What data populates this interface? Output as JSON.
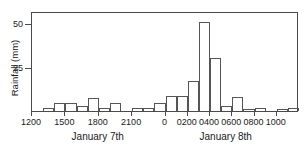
{
  "chart_data": {
    "type": "bar",
    "title": "",
    "subtitle": "",
    "xlabel": "",
    "ylabel": "Raintall (mm)",
    "ylabel_actual": "Rainfall (mm)",
    "ylim": [
      0,
      57
    ],
    "xlim": [
      1200,
      1200
    ],
    "grid": false,
    "legend": null,
    "y_ticks": [
      {
        "value": 25,
        "label": "25"
      },
      {
        "value": 50,
        "label": "50"
      }
    ],
    "x_ticks": [
      {
        "value": 1200,
        "label": "1200"
      },
      {
        "value": 1500,
        "label": "1500"
      },
      {
        "value": 1800,
        "label": "1800"
      },
      {
        "value": 2100,
        "label": "2100"
      },
      {
        "value": 2400,
        "label": "0"
      },
      {
        "value": 2600,
        "label": "0200"
      },
      {
        "value": 2800,
        "label": "0400"
      },
      {
        "value": 3000,
        "label": "0600"
      },
      {
        "value": 3200,
        "label": "0800"
      },
      {
        "value": 3400,
        "label": "1000"
      }
    ],
    "x_group_labels": [
      {
        "label": "January 7th",
        "center": 1800
      },
      {
        "label": "January 8th",
        "center": 2950
      }
    ],
    "bar_interval_hours": 1,
    "categories": [
      "1200",
      "1300",
      "1400",
      "1500",
      "1600",
      "1700",
      "1800",
      "1900",
      "2000",
      "2100",
      "2200",
      "2300",
      "0000",
      "0100",
      "0200",
      "0300",
      "0400",
      "0500",
      "0600",
      "0700",
      "0800",
      "0900",
      "1000",
      "1100"
    ],
    "values": [
      0,
      1.5,
      4.5,
      4.5,
      3.0,
      7.5,
      1.5,
      4.5,
      0,
      2.0,
      2.0,
      4.5,
      8.5,
      8.5,
      17.0,
      51.0,
      30.0,
      3.0,
      8.0,
      1.0,
      2.0,
      0,
      1.0,
      2.0
    ],
    "colors": {
      "bar_stroke": "#555555",
      "bar_fill": "transparent",
      "axis": "#4a4a4a",
      "text": "#1a1a1a",
      "background": "#ffffff"
    }
  }
}
